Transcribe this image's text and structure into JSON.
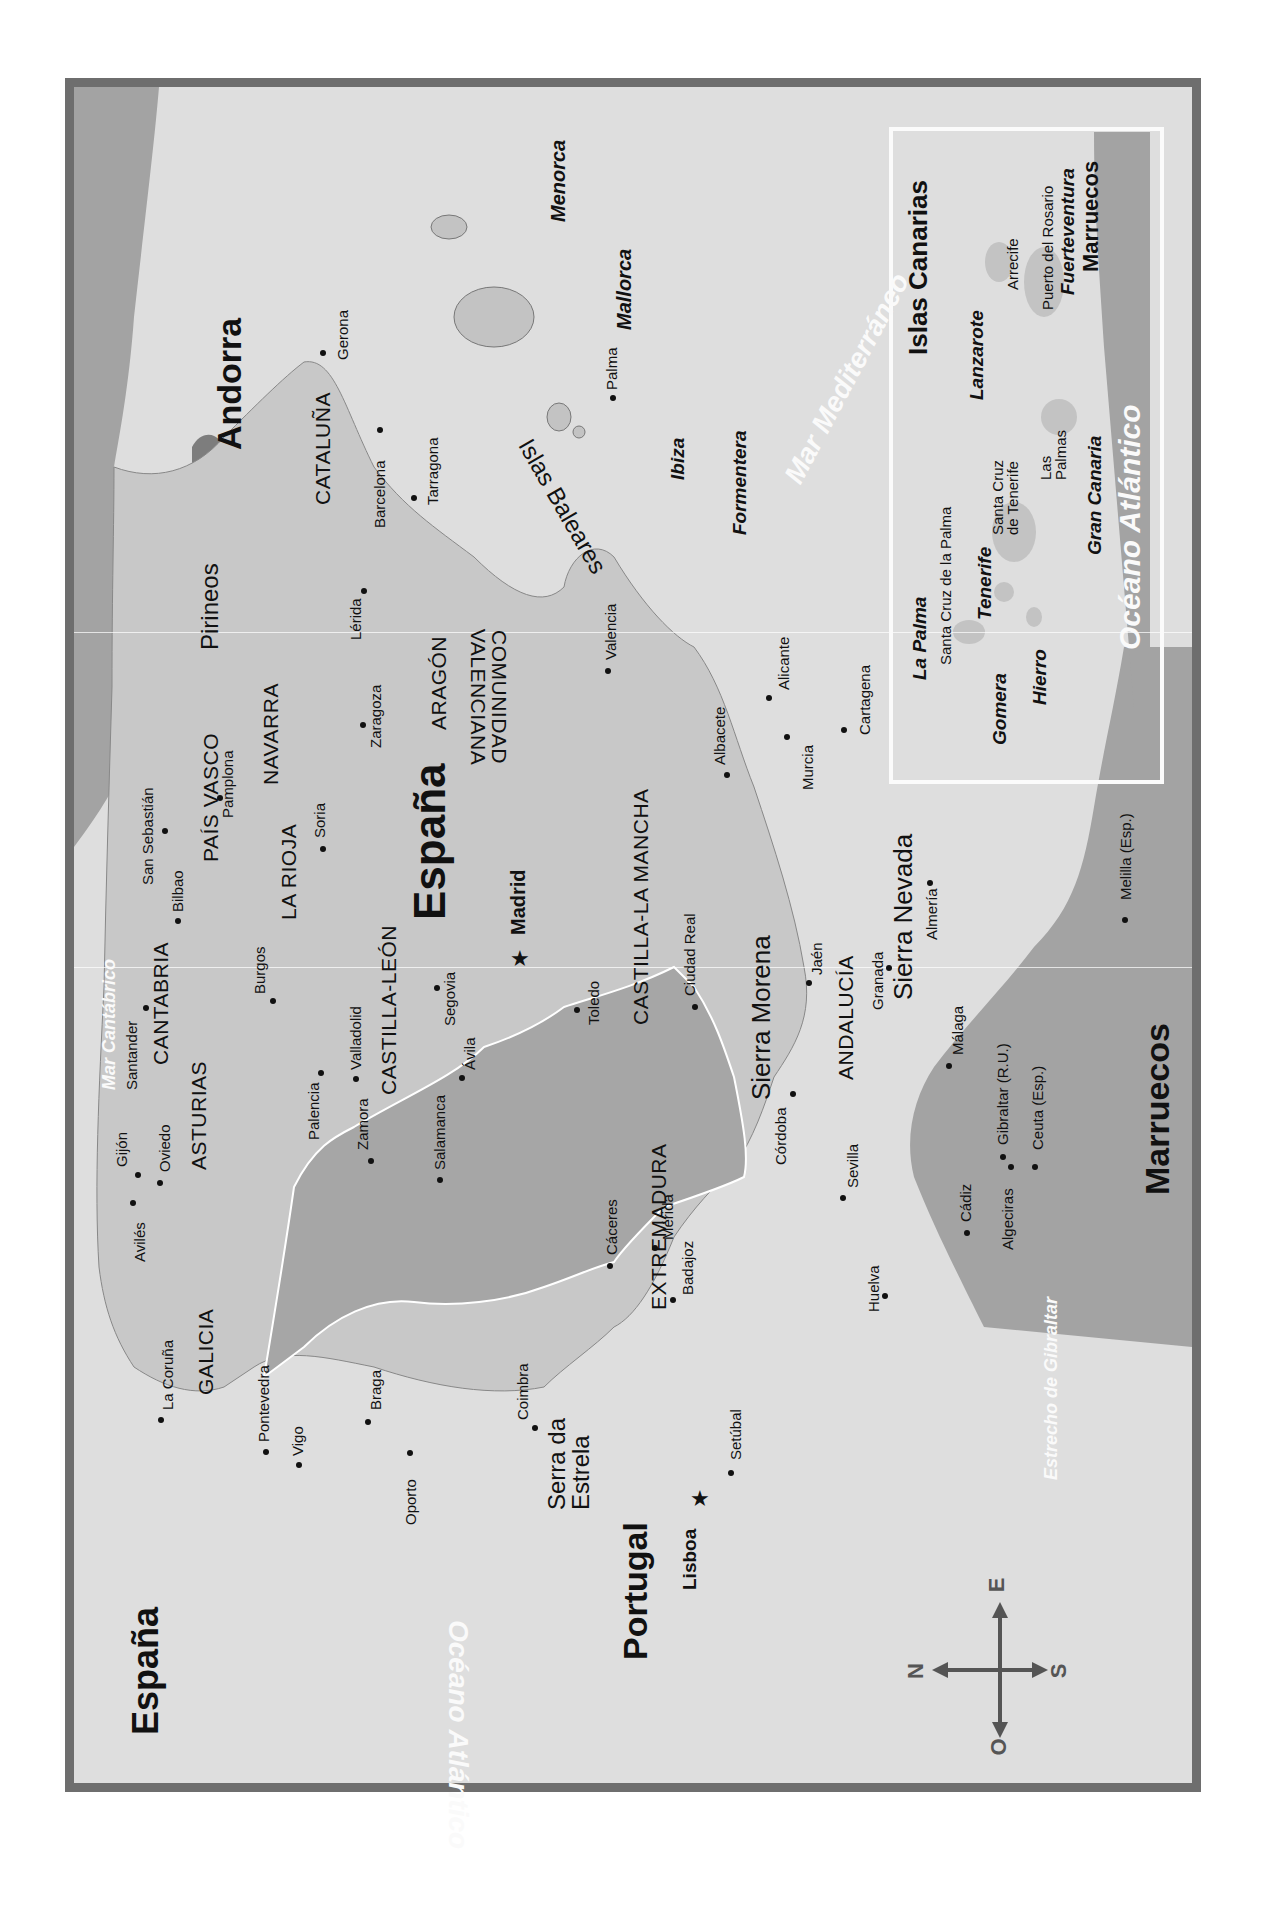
{
  "map": {
    "title": "España",
    "orientation": "rotated 90° (north points left)",
    "countries": {
      "spain": "España",
      "portugal": "Portugal",
      "andorra": "Andorra",
      "morocco": "Marruecos",
      "morocco_inset": "Marruecos"
    },
    "seas": {
      "atlantic": "Océano Atlántico",
      "atlantic_inset": "Océano Atlántico",
      "mediterranean": "Mar Mediterráneo",
      "cantabrian": "Mar Cantábrico",
      "strait": "Estrecho de Gibraltar"
    },
    "mountains": {
      "pyrenees": "Pirineos",
      "sierra_morena": "Sierra Morena",
      "sierra_nevada": "Sierra Nevada",
      "serra_estrela": "Serra da Estrela"
    },
    "regions": [
      "GALICIA",
      "ASTURIAS",
      "CANTABRIA",
      "PAÍS VASCO",
      "NAVARRA",
      "LA RIOJA",
      "CASTILLA-LEÓN",
      "ARAGÓN",
      "CATALUÑA",
      "COMUNIDAD VALENCIANA",
      "CASTILLA-LA MANCHA",
      "EXTREMADURA",
      "ANDALUCÍA"
    ],
    "capitals": {
      "madrid": "Madrid",
      "lisboa": "Lisboa"
    },
    "cities": [
      "La Coruña",
      "Pontevedra",
      "Vigo",
      "Avilés",
      "Gijón",
      "Oviedo",
      "Santander",
      "Bilbao",
      "San Sebastián",
      "Pamplona",
      "Burgos",
      "Palencia",
      "Valladolid",
      "Zamora",
      "Salamanca",
      "Ávila",
      "Segovia",
      "Soria",
      "Zaragoza",
      "Lérida",
      "Gerona",
      "Barcelona",
      "Tarragona",
      "Valencia",
      "Alicante",
      "Albacete",
      "Murcia",
      "Cartagena",
      "Toledo",
      "Ciudad Real",
      "Cáceres",
      "Mérida",
      "Badajoz",
      "Córdoba",
      "Jaén",
      "Granada",
      "Almería",
      "Málaga",
      "Sevilla",
      "Huelva",
      "Cádiz",
      "Algeciras",
      "Gibraltar (R.U.)",
      "Ceuta (Esp.)",
      "Melilla (Esp.)",
      "Oporto",
      "Braga",
      "Coimbra",
      "Setúbal"
    ],
    "balearics": {
      "group": "Islas Baleares",
      "islands": [
        "Menorca",
        "Mallorca",
        "Ibiza",
        "Formentera"
      ],
      "city": "Palma"
    },
    "canary_inset": {
      "title": "Islas Canarias",
      "islands": [
        "La Palma",
        "Tenerife",
        "Gomera",
        "Hierro",
        "Gran Canaria",
        "Lanzarote",
        "Fuerteventura"
      ],
      "cities": [
        "Santa Cruz de la Palma",
        "Santa Cruz de Tenerife",
        "Las Palmas",
        "Arrecife",
        "Puerto del Rosario"
      ]
    },
    "compass": {
      "n": "N",
      "s": "S",
      "e": "E",
      "o": "O"
    },
    "colors": {
      "frame": "#6e6e6e",
      "sea": "#dedede",
      "spain_land": "#c9c9c9",
      "foreign_land": "#9f9f9f",
      "border_line": "#ffffff",
      "text": "#111111"
    }
  }
}
